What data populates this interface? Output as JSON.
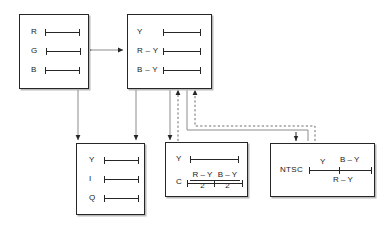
{
  "diagram": {
    "ink_color": "#262626",
    "shadow_color": "#b9b9b9",
    "background": "#ffffff"
  },
  "boxes": {
    "rgb": {
      "name": "RGB component box",
      "signals": [
        {
          "label": "R"
        },
        {
          "label": "G"
        },
        {
          "label": "B"
        }
      ]
    },
    "colour_difference": {
      "name": "Luminance and colour difference box",
      "signals": [
        {
          "label": "Y"
        },
        {
          "label": "R – Y"
        },
        {
          "label": "B – Y"
        }
      ]
    },
    "yiq": {
      "name": "YIQ component box",
      "signals": [
        {
          "label": "Y"
        },
        {
          "label": "I"
        },
        {
          "label": "Q"
        }
      ]
    },
    "yc": {
      "name": "Y C separate box",
      "rows": [
        {
          "label": "Y",
          "kind": "bar"
        },
        {
          "label": "C",
          "kind": "fractions",
          "fractions": [
            {
              "numerator": "R – Y",
              "denominator": "2"
            },
            {
              "numerator": "B – Y",
              "denominator": "2"
            }
          ]
        }
      ]
    },
    "ntsc": {
      "name": "NTSC composite box",
      "label": "NTSC",
      "annotations": {
        "above_left": "Y",
        "above_right": "B – Y",
        "below_right": "R – Y"
      }
    }
  },
  "connections": [
    {
      "from": "rgb",
      "to": "colour_difference",
      "style": "solid",
      "arrows": "both",
      "orientation": "horizontal"
    },
    {
      "from": "rgb",
      "to": "yiq",
      "style": "solid",
      "arrows": "both",
      "orientation": "vertical"
    },
    {
      "from": "colour_difference",
      "to": "yiq",
      "style": "solid",
      "arrows": "both",
      "orientation": "vertical"
    },
    {
      "from": "colour_difference",
      "to": "yc",
      "style": "solid",
      "arrows": "end",
      "orientation": "vertical"
    },
    {
      "from": "yc",
      "to": "colour_difference",
      "style": "dashed",
      "arrows": "end",
      "orientation": "vertical"
    },
    {
      "from": "ntsc",
      "to": "colour_difference",
      "style": "dashed",
      "arrows": "end",
      "orientation": "routed"
    },
    {
      "from": "colour_difference",
      "to": "ntsc",
      "style": "solid",
      "arrows": "end",
      "orientation": "routed"
    }
  ]
}
